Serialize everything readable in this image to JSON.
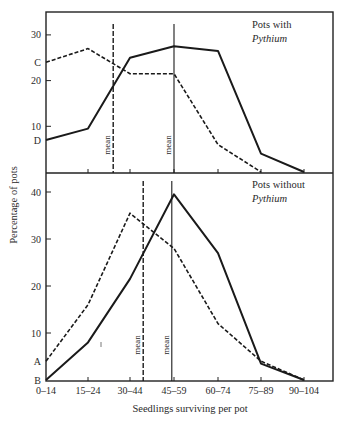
{
  "figure": {
    "ylabel": "Percentage of pots",
    "xlabel": "Seedlings surviving per pot",
    "mean_label": "mean"
  },
  "chart_data": [
    {
      "type": "line",
      "panel": "top",
      "title_line1": "Pots with",
      "title_line2": "Pythium",
      "categories": [
        "0–14",
        "15–24",
        "30–44",
        "45–59",
        "60–74",
        "75–89",
        "90–104"
      ],
      "ylabel": "Percentage of pots",
      "xlabel": "Seedlings surviving per pot",
      "yticks": [
        10,
        20,
        30
      ],
      "ylim": [
        0,
        35
      ],
      "y_markers": [
        {
          "label": "C",
          "value": 24
        },
        {
          "label": "D",
          "value": 7
        }
      ],
      "series": [
        {
          "name": "solid",
          "style": "solid",
          "values": [
            7,
            9.5,
            25,
            27.5,
            26.5,
            4,
            0
          ]
        },
        {
          "name": "dashed",
          "style": "dashed",
          "values": [
            24,
            27,
            21.5,
            21.5,
            6,
            0,
            null
          ]
        }
      ],
      "means": [
        {
          "style": "dashed",
          "position": 1.6
        },
        {
          "style": "solid",
          "position": 3.0
        }
      ],
      "grid": false
    },
    {
      "type": "line",
      "panel": "bottom",
      "title_line1": "Pots without",
      "title_line2": "Pythium",
      "categories": [
        "0–14",
        "15–24",
        "30–44",
        "45–59",
        "60–74",
        "75–89",
        "90–104"
      ],
      "ylabel": "Percentage of pots",
      "xlabel": "Seedlings surviving per pot",
      "yticks": [
        10,
        20,
        30,
        40
      ],
      "ylim": [
        0,
        44
      ],
      "y_markers": [
        {
          "label": "A",
          "value": 4
        },
        {
          "label": "B",
          "value": 0
        }
      ],
      "series": [
        {
          "name": "solid",
          "style": "solid",
          "values": [
            0,
            8,
            21.5,
            39.5,
            27,
            3.5,
            0
          ]
        },
        {
          "name": "dashed",
          "style": "dashed",
          "values": [
            4,
            16,
            35.5,
            28,
            12,
            4,
            0
          ]
        }
      ],
      "means": [
        {
          "style": "dashed",
          "position": 2.3
        },
        {
          "style": "solid",
          "position": 2.95
        }
      ],
      "grid": false
    }
  ]
}
